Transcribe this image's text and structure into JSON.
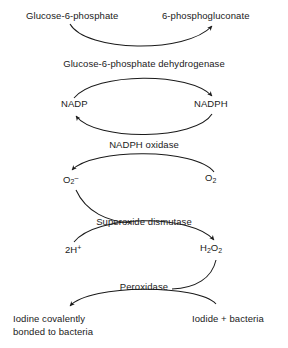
{
  "diagram": {
    "stroke_color": "#1a1a1a",
    "background_color": "#ffffff",
    "nodes": {
      "glucose_6_phosphate": "Glucose-6-phosphate",
      "phosphogluconate": "6-phosphogluconate",
      "nadp": "NADP",
      "nadph": "NADPH",
      "superoxide_base": "O",
      "superoxide_sub": "2",
      "superoxide_sup": "–",
      "oxygen_base": "O",
      "oxygen_sub": "2",
      "proton_base": "2H",
      "proton_sup": "+",
      "peroxide_base_h": "H",
      "peroxide_sub_h": "2",
      "peroxide_base_o": "O",
      "peroxide_sub_o": "2",
      "iodine_bound": "Iodine covalently\nbonded to bacteria",
      "iodide_bacteria": "Iodide + bacteria"
    },
    "enzymes": {
      "g6pd": "Glucose-6-phosphate dehydrogenase",
      "nadph_oxidase": "NADPH oxidase",
      "superoxide_dismutase": "Superoxide dismutase",
      "peroxidase": "Peroxidase"
    }
  }
}
